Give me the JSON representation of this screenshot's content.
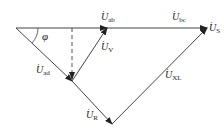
{
  "diagram": {
    "type": "phasor-diagram",
    "angle_label": "φ",
    "phasors": [
      {
        "id": "ab",
        "base": "U",
        "sub": "ab",
        "from": [
          16,
          28
        ],
        "to": [
          107,
          28
        ]
      },
      {
        "id": "bc",
        "base": "U",
        "sub": "bc",
        "from": [
          107,
          28
        ],
        "to": [
          207,
          28
        ]
      },
      {
        "id": "ad",
        "base": "U",
        "sub": "ad",
        "from": [
          16,
          28
        ],
        "to": [
          72,
          81
        ]
      },
      {
        "id": "R",
        "base": "U",
        "sub": "R",
        "from": [
          72,
          81
        ],
        "to": [
          112,
          124
        ]
      },
      {
        "id": "XL",
        "base": "U",
        "sub": "XL",
        "from": [
          112,
          124
        ],
        "to": [
          207,
          28
        ]
      },
      {
        "id": "V",
        "base": "U",
        "sub": "V",
        "from": [
          72,
          81
        ],
        "to": [
          107,
          28
        ]
      },
      {
        "id": "S",
        "base": "U",
        "sub": "S",
        "from": [
          16,
          28
        ],
        "to": [
          207,
          28
        ]
      }
    ],
    "dashed_projection": {
      "from": [
        72,
        28
      ],
      "to": [
        72,
        81
      ]
    },
    "colors": {
      "line": "#333333",
      "dashed": "#555555",
      "text": "#222222"
    }
  },
  "labels": {
    "ab": {
      "base": "U",
      "sub": "ab"
    },
    "bc": {
      "base": "U",
      "sub": "bc"
    },
    "S": {
      "base": "U",
      "sub": "S"
    },
    "V": {
      "base": "U",
      "sub": "V"
    },
    "ad": {
      "base": "U",
      "sub": "ad"
    },
    "XL": {
      "base": "U",
      "sub": "XL"
    },
    "R": {
      "base": "U",
      "sub": "R"
    },
    "phi": "φ",
    "dot": "·"
  }
}
